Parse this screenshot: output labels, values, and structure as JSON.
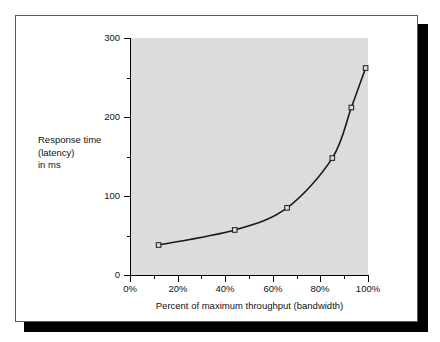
{
  "figure": {
    "background_color": "#ffffff",
    "frame_border_color": "#5a5a5a",
    "shadow_color": "#000000",
    "plot_background_color": "#dcdcdc"
  },
  "chart_data": {
    "type": "line",
    "title": "",
    "subtitle": "",
    "xlabel": "Percent of maximum throughput (bandwidth)",
    "ylabel": "Response time\n(latency)\nin ms",
    "ylabel_lines": [
      "Response time",
      "(latency)",
      "in ms"
    ],
    "x": [
      12,
      44,
      66,
      85,
      93,
      99
    ],
    "values": [
      38,
      57,
      85,
      148,
      212,
      262
    ],
    "series": [
      {
        "name": "Response time vs throughput",
        "x": [
          12,
          44,
          66,
          85,
          93,
          99
        ],
        "values": [
          38,
          57,
          85,
          148,
          212,
          262
        ],
        "line_color": "#1a1a1a",
        "marker": "open-square",
        "marker_edge_color": "#1a1a1a",
        "marker_face_color": "#dcdcdc"
      }
    ],
    "xlim": [
      0,
      100
    ],
    "ylim": [
      0,
      300
    ],
    "xticks": [
      0,
      20,
      40,
      60,
      80,
      100
    ],
    "xtick_labels": [
      "0%",
      "20%",
      "40%",
      "60%",
      "80%",
      "100%"
    ],
    "xticks_minor": [
      10,
      30,
      50,
      70,
      90
    ],
    "yticks": [
      0,
      100,
      200,
      300
    ],
    "ytick_labels": [
      "0",
      "100",
      "200",
      "300"
    ],
    "yticks_minor": [
      50,
      150,
      250
    ],
    "grid": false,
    "legend": null,
    "legend_position": "none",
    "annotations": []
  }
}
